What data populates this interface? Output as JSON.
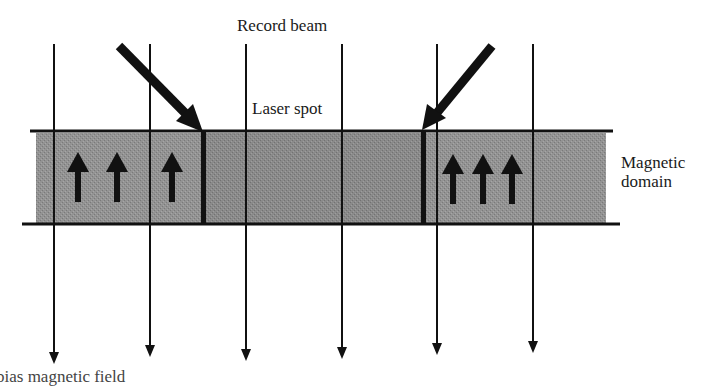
{
  "figure": {
    "labels": {
      "record_beam": "Record beam",
      "laser_spot": "Laser spot",
      "magnetic_domain_line1": "Magnetic",
      "magnetic_domain_line2": "domain",
      "bias_field": "bias magnetic field"
    },
    "colors": {
      "background": "#ffffff",
      "ink": "#111111",
      "medium_fill": "#8f8f8f",
      "medium_fill_center": "#878787"
    },
    "field_lines_x": [
      54,
      150,
      246,
      342,
      437,
      533
    ],
    "domain_walls_x": [
      203,
      424
    ],
    "up_arrows_left_x": [
      78,
      117,
      172
    ],
    "up_arrows_right_x": [
      452,
      483,
      512
    ],
    "recording_layer": {
      "top_y": 131,
      "bottom_y": 224,
      "left_x": 36,
      "right_x": 606
    }
  }
}
